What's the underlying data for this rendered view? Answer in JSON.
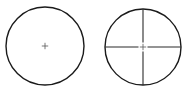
{
  "page": {
    "background_color": "#ffffff",
    "width": 189,
    "height": 96
  },
  "style": {
    "circle_stroke_color": "#1a1a1a",
    "circle_stroke_width": 1.4,
    "reticle_stroke_color": "#2b2b2b",
    "reticle_stroke_width": 1.1,
    "center_mark_color": "#555555",
    "center_mark_width": 0.8
  },
  "figures": [
    {
      "name": "plain-dot-reticle",
      "label": "",
      "center_x": 45,
      "center_y": 46,
      "radius": 39,
      "reticle_type": "fine-center-cross",
      "center_mark": {
        "type": "plus",
        "arm_length": 3.2
      },
      "crosshair": {
        "horizontal": false,
        "vertical": false
      }
    },
    {
      "name": "duplex-crosshair-reticle",
      "label": "",
      "center_x": 143,
      "center_y": 47,
      "radius": 38,
      "reticle_type": "full-crosshair",
      "center_mark": {
        "type": "plus",
        "arm_length": 3.2
      },
      "crosshair": {
        "horizontal": true,
        "vertical": true,
        "center_gap": 4.5
      }
    }
  ]
}
